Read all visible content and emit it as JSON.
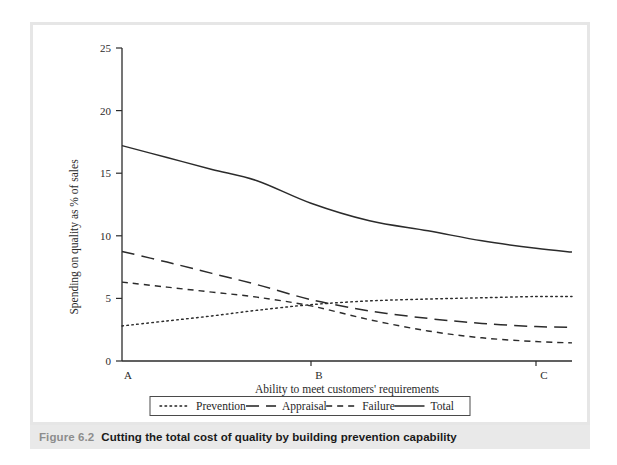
{
  "caption": {
    "figure_label": "Figure 6.2",
    "title": "Cutting the total cost of quality by building prevention capability"
  },
  "chart_data": {
    "type": "line",
    "title": "",
    "xlabel": "Ability to meet customers' requirements",
    "ylabel": "Spending on quality as % of sales",
    "ylim": [
      0,
      25
    ],
    "yticks": [
      0,
      5,
      10,
      15,
      20,
      25
    ],
    "ytick_labels": [
      "0",
      "5",
      "10",
      "15",
      "20",
      "25"
    ],
    "xtick_labels": [
      "A",
      "B",
      "C"
    ],
    "xtick_positions": [
      0.0,
      0.42,
      0.92
    ],
    "grid": false,
    "legend_position": "below-axis",
    "x": [
      0.0,
      0.1,
      0.2,
      0.3,
      0.42,
      0.55,
      0.68,
      0.8,
      0.92,
      1.0
    ],
    "series": [
      {
        "name": "Prevention",
        "style": "dotted",
        "values": [
          2.8,
          3.2,
          3.6,
          4.05,
          4.5,
          4.8,
          4.95,
          5.05,
          5.15,
          5.15
        ]
      },
      {
        "name": "Appraisal",
        "style": "dashed-long",
        "values": [
          8.75,
          7.9,
          7.0,
          6.1,
          4.9,
          4.0,
          3.4,
          3.0,
          2.75,
          2.7
        ]
      },
      {
        "name": "Failure",
        "style": "dashed-short",
        "values": [
          6.3,
          5.9,
          5.5,
          5.1,
          4.4,
          3.3,
          2.4,
          1.85,
          1.55,
          1.45
        ]
      },
      {
        "name": "Total",
        "style": "solid",
        "values": [
          17.2,
          16.25,
          15.3,
          14.4,
          12.6,
          11.2,
          10.4,
          9.6,
          9.0,
          8.7
        ]
      }
    ]
  },
  "legend": {
    "items": [
      {
        "label": "Prevention",
        "style": "dotted"
      },
      {
        "label": "Appraisal",
        "style": "dashed-long"
      },
      {
        "label": "Failure",
        "style": "dashed-short"
      },
      {
        "label": "Total",
        "style": "solid"
      }
    ]
  }
}
